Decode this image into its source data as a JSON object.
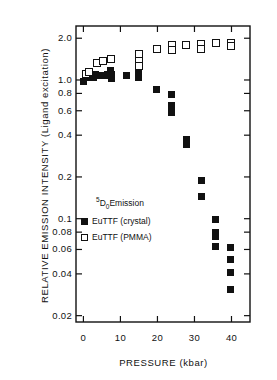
{
  "chart_data": {
    "type": "scatter",
    "title": "",
    "xlabel": "PRESSURE (kbar)",
    "ylabel": "RELATIVE EMISSION INTENSITY (Ligand excitation)",
    "yscale": "log",
    "xlim": [
      -2,
      45
    ],
    "ylim": [
      0.018,
      2.45
    ],
    "grid": false,
    "legend_position": "inner-left-lower",
    "legend_title": "5D0 Emission",
    "xticks": [
      0,
      10,
      20,
      30,
      40
    ],
    "xtick_labels": [
      "0",
      "10",
      "20",
      "30",
      "40"
    ],
    "yticks": [
      2.0,
      1.0,
      0.8,
      0.6,
      0.4,
      0.2,
      0.1,
      0.08,
      0.06,
      0.04,
      0.02
    ],
    "ytick_labels": [
      "2.0",
      "1.0",
      "0.8",
      "0.6",
      "0.4",
      "0.2",
      "0.1",
      "0.08",
      "0.06",
      "0.04",
      "0.02"
    ],
    "series": [
      {
        "name": "EuTTF (crystal)",
        "marker": "filled-square",
        "color": "#111111",
        "points": [
          [
            0.0,
            0.97
          ],
          [
            1.0,
            1.05
          ],
          [
            1.8,
            1.06
          ],
          [
            2.6,
            1.05
          ],
          [
            3.4,
            1.1
          ],
          [
            4.6,
            1.08
          ],
          [
            5.6,
            1.07
          ],
          [
            6.6,
            1.09
          ],
          [
            7.4,
            1.18
          ],
          [
            7.6,
            1.1
          ],
          [
            7.6,
            1.02
          ],
          [
            11.6,
            1.07
          ],
          [
            15.0,
            1.23
          ],
          [
            15.0,
            1.13
          ],
          [
            15.0,
            1.04
          ],
          [
            19.8,
            0.86
          ],
          [
            23.8,
            0.78
          ],
          [
            23.8,
            0.65
          ],
          [
            23.8,
            0.58
          ],
          [
            27.8,
            0.37
          ],
          [
            27.8,
            0.345
          ],
          [
            31.8,
            0.19
          ],
          [
            31.8,
            0.145
          ],
          [
            35.8,
            0.098
          ],
          [
            35.8,
            0.08
          ],
          [
            35.8,
            0.074
          ],
          [
            35.8,
            0.063
          ],
          [
            39.8,
            0.062
          ],
          [
            39.8,
            0.051
          ],
          [
            39.8,
            0.041
          ],
          [
            39.8,
            0.031
          ]
        ]
      },
      {
        "name": "EuTTF (PMMA)",
        "marker": "open-square",
        "color": "#111111",
        "points": [
          [
            0.6,
            1.1
          ],
          [
            1.4,
            1.15
          ],
          [
            3.6,
            1.33
          ],
          [
            5.4,
            1.37
          ],
          [
            7.4,
            1.41
          ],
          [
            15.0,
            1.54
          ],
          [
            15.0,
            1.37
          ],
          [
            15.0,
            1.27
          ],
          [
            19.8,
            1.67
          ],
          [
            23.8,
            1.78
          ],
          [
            23.8,
            1.65
          ],
          [
            27.8,
            1.8
          ],
          [
            31.8,
            1.82
          ],
          [
            31.8,
            1.68
          ],
          [
            35.8,
            1.86
          ],
          [
            39.8,
            1.85
          ],
          [
            39.8,
            1.76
          ]
        ]
      }
    ]
  },
  "legend": {
    "title_pre": "5",
    "title_d": "D",
    "title_sub": "0",
    "title_post": "Emission",
    "entries": [
      {
        "label": "EuTTF (crystal)",
        "marker": "filled-square"
      },
      {
        "label": "EuTTF (PMMA)",
        "marker": "open-square"
      }
    ]
  }
}
